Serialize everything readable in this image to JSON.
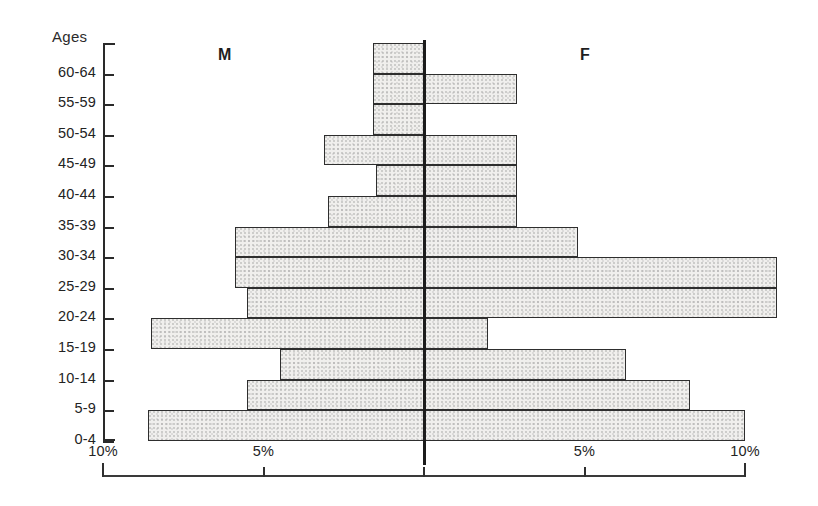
{
  "figure": {
    "y_axis_title": "Ages",
    "male_label": "M",
    "female_label": "F"
  },
  "chart_data": {
    "type": "bar",
    "subtype": "population-pyramid",
    "title": "",
    "subtitle": "",
    "xlabel": "",
    "ylabel": "Ages",
    "grid": false,
    "legend_position": "inside-top",
    "orientation": "horizontal",
    "axis_unit": "%",
    "xlim": [
      -10,
      10
    ],
    "x_tick_labels": [
      "10%",
      "5%",
      "",
      "5%",
      "10%"
    ],
    "x_tick_values": [
      -10,
      -5,
      0,
      5,
      10
    ],
    "categories": [
      "60-64",
      "55-59",
      "50-54",
      "45-49",
      "40-44",
      "35-39",
      "30-34",
      "25-29",
      "20-24",
      "15-19",
      "10-14",
      "5-9",
      "0-4"
    ],
    "series": [
      {
        "name": "M",
        "side": "left",
        "values": [
          1.6,
          1.6,
          1.6,
          3.1,
          1.5,
          3.0,
          5.9,
          5.9,
          5.5,
          8.5,
          4.5,
          5.5,
          8.6
        ]
      },
      {
        "name": "F",
        "side": "right",
        "values": [
          0.0,
          2.9,
          0.0,
          2.9,
          2.9,
          2.9,
          4.8,
          11.0,
          11.0,
          2.0,
          6.3,
          8.3,
          10.0
        ]
      }
    ],
    "colors": {
      "bar_fill": "#f0efed",
      "bar_stroke": "#2e2e2e",
      "axis": "#2a2a2a",
      "text": "#232323"
    }
  },
  "x_ticks": [
    {
      "label": "10%",
      "value": -10
    },
    {
      "label": "5%",
      "value": -5
    },
    {
      "label": "",
      "value": 0
    },
    {
      "label": "5%",
      "value": 5
    },
    {
      "label": "10%",
      "value": 10
    }
  ]
}
